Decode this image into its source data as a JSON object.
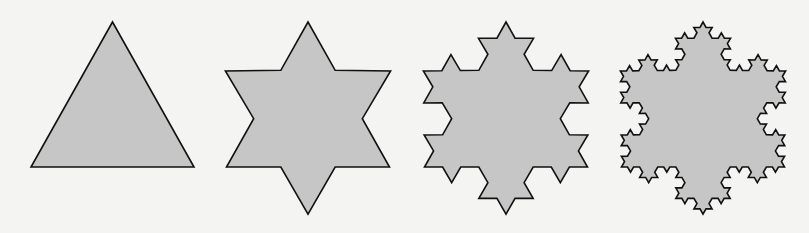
{
  "figure": {
    "background": "#f4f4f2",
    "fill_color": "#c6c6c6",
    "stroke_color": "#111111",
    "shapes": [
      {
        "name": "koch-iteration-0",
        "iteration": 0,
        "cx": 112.5,
        "top": 22,
        "base": 167,
        "width": 163
      },
      {
        "name": "koch-iteration-1",
        "iteration": 1,
        "cx": 308,
        "top": 22,
        "base": 167,
        "width": 163
      },
      {
        "name": "koch-iteration-2",
        "iteration": 2,
        "cx": 506,
        "top": 22,
        "base": 167,
        "width": 163
      },
      {
        "name": "koch-iteration-3",
        "iteration": 3,
        "cx": 703,
        "top": 22,
        "base": 167,
        "width": 163
      }
    ]
  }
}
